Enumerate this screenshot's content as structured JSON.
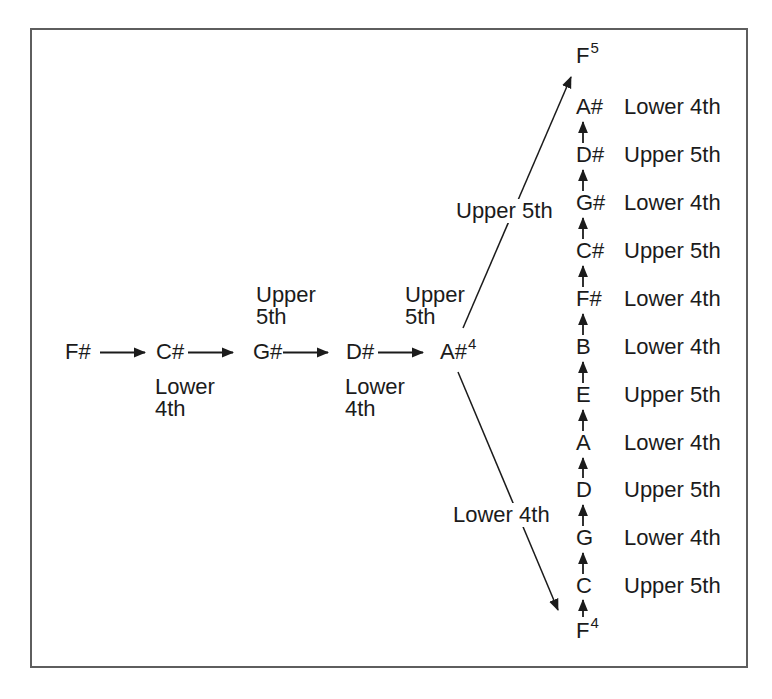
{
  "figure": {
    "colors": {
      "ink": "#1b1b1b",
      "border": "#5e5e5e",
      "background": "#ffffff"
    },
    "chain": {
      "notes": [
        {
          "note": "F#",
          "sup": ""
        },
        {
          "note": "C#",
          "sup": ""
        },
        {
          "note": "G#",
          "sup": ""
        },
        {
          "note": "D#",
          "sup": ""
        },
        {
          "note": "A#",
          "sup": "4"
        }
      ],
      "step_labels": [
        {
          "line1": "Upper",
          "line2": "5th"
        },
        {
          "line1": "Upper",
          "line2": "5th"
        },
        {
          "line1": "Lower",
          "line2": "4th"
        },
        {
          "line1": "Lower",
          "line2": "4th"
        }
      ]
    },
    "diagonals": {
      "up_label": "Upper 5th",
      "down_label": "Lower 4th"
    },
    "column": {
      "rows": [
        {
          "note": "F",
          "sup": "5",
          "label": ""
        },
        {
          "note": "A#",
          "sup": "",
          "label": "Lower 4th"
        },
        {
          "note": "D#",
          "sup": "",
          "label": "Upper 5th"
        },
        {
          "note": "G#",
          "sup": "",
          "label": "Lower 4th"
        },
        {
          "note": "C#",
          "sup": "",
          "label": "Upper 5th"
        },
        {
          "note": "F#",
          "sup": "",
          "label": "Lower 4th"
        },
        {
          "note": "B",
          "sup": "",
          "label": "Lower 4th"
        },
        {
          "note": "E",
          "sup": "",
          "label": "Upper 5th"
        },
        {
          "note": "A",
          "sup": "",
          "label": "Lower 4th"
        },
        {
          "note": "D",
          "sup": "",
          "label": "Upper 5th"
        },
        {
          "note": "G",
          "sup": "",
          "label": "Lower 4th"
        },
        {
          "note": "C",
          "sup": "",
          "label": "Upper 5th"
        },
        {
          "note": "F",
          "sup": "4",
          "label": ""
        }
      ]
    }
  }
}
